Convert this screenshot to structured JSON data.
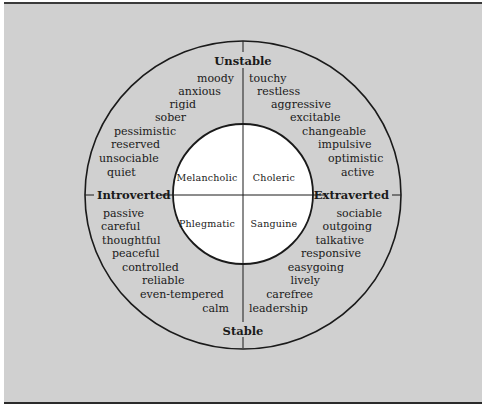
{
  "diagram": {
    "axes": {
      "top": "Unstable",
      "bottom": "Stable",
      "left": "Introverted",
      "right": "Extraverted"
    },
    "temperaments": {
      "top_left": "Melancholic",
      "top_right": "Choleric",
      "bottom_left": "Phlegmatic",
      "bottom_right": "Sanguine"
    },
    "traits": {
      "unstable_introverted": [
        "moody",
        "anxious",
        "rigid",
        "sober",
        "pessimistic",
        "reserved",
        "unsociable",
        "quiet"
      ],
      "unstable_extraverted": [
        "touchy",
        "restless",
        "aggressive",
        "excitable",
        "changeable",
        "impulsive",
        "optimistic",
        "active"
      ],
      "stable_introverted": [
        "passive",
        "careful",
        "thoughtful",
        "peaceful",
        "controlled",
        "reliable",
        "even-tempered",
        "calm"
      ],
      "stable_extraverted": [
        "sociable",
        "outgoing",
        "talkative",
        "responsive",
        "easygoing",
        "lively",
        "carefree",
        "leadership"
      ]
    },
    "colors": {
      "background": "#d0d0d0",
      "inner_circle": "#ffffff",
      "lines": "#1a1a1a"
    }
  }
}
